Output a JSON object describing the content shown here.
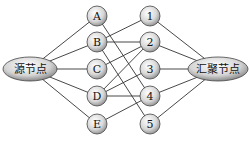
{
  "diagram": {
    "source": {
      "label": "源节点",
      "cx": 30,
      "cy": 69,
      "rx": 27,
      "ry": 12
    },
    "sink": {
      "label": "汇聚节点",
      "cx": 218,
      "cy": 69,
      "rx": 30,
      "ry": 12
    },
    "left_nodes": [
      {
        "id": "A",
        "label": "A",
        "cx": 97,
        "cy": 16
      },
      {
        "id": "B",
        "label": "B",
        "cx": 97,
        "cy": 42
      },
      {
        "id": "C",
        "label": "C",
        "cx": 97,
        "cy": 69
      },
      {
        "id": "D",
        "label": "D",
        "cx": 97,
        "cy": 96
      },
      {
        "id": "E",
        "label": "E",
        "cx": 97,
        "cy": 124
      }
    ],
    "right_nodes": [
      {
        "id": "1",
        "label": "1",
        "cx": 150,
        "cy": 16
      },
      {
        "id": "2",
        "label": "2",
        "cx": 150,
        "cy": 42
      },
      {
        "id": "3",
        "label": "3",
        "cx": 150,
        "cy": 69
      },
      {
        "id": "4",
        "label": "4",
        "cx": 150,
        "cy": 96
      },
      {
        "id": "5",
        "label": "5",
        "cx": 150,
        "cy": 124
      }
    ],
    "middle_edges": [
      [
        "A",
        "4"
      ],
      [
        "B",
        "1"
      ],
      [
        "B",
        "2"
      ],
      [
        "B",
        "5"
      ],
      [
        "C",
        "2"
      ],
      [
        "D",
        "2"
      ],
      [
        "D",
        "3"
      ],
      [
        "D",
        "4"
      ],
      [
        "E",
        "4"
      ]
    ],
    "node_radius": 10
  }
}
